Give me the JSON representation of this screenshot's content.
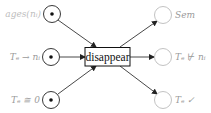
{
  "diagram": {
    "type": "petri-net",
    "transition": {
      "label": "disappear"
    },
    "input_places": [
      {
        "label": "ages(nᵢ)",
        "token": true
      },
      {
        "label": "Tₑ → nᵢ",
        "token": true
      },
      {
        "label": "Tₑ ≅ 0",
        "token": true
      }
    ],
    "output_places": [
      {
        "label": "Sem",
        "token": false
      },
      {
        "label": "Tₑ ⊬ nᵢ",
        "token": false
      },
      {
        "label": "Tₑ ✓",
        "token": false
      }
    ],
    "colors": {
      "arc": "#333333",
      "place_in": "#222222",
      "place_out": "#bbbbbb",
      "label": "#9a9a9a"
    }
  }
}
